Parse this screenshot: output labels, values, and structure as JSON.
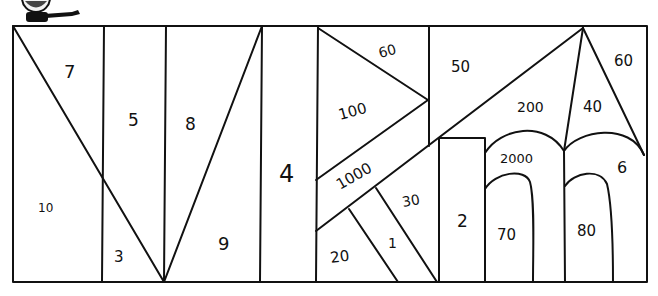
{
  "puzzle": {
    "type": "colour-by-number line drawing",
    "mascot": "cartoon-character-pointing",
    "regions": [
      {
        "id": "r7",
        "label": "7"
      },
      {
        "id": "r10",
        "label": "10"
      },
      {
        "id": "r5",
        "label": "5"
      },
      {
        "id": "r3",
        "label": "3"
      },
      {
        "id": "r8",
        "label": "8"
      },
      {
        "id": "r9",
        "label": "9"
      },
      {
        "id": "r4",
        "label": "4"
      },
      {
        "id": "r60a",
        "label": "60"
      },
      {
        "id": "r100",
        "label": "100"
      },
      {
        "id": "r1000",
        "label": "1000"
      },
      {
        "id": "r30",
        "label": "30"
      },
      {
        "id": "r1",
        "label": "1"
      },
      {
        "id": "r20",
        "label": "20"
      },
      {
        "id": "r50",
        "label": "50"
      },
      {
        "id": "r200",
        "label": "200"
      },
      {
        "id": "r2",
        "label": "2"
      },
      {
        "id": "r2000",
        "label": "2000"
      },
      {
        "id": "r70",
        "label": "70"
      },
      {
        "id": "r40",
        "label": "40"
      },
      {
        "id": "r60b",
        "label": "60"
      },
      {
        "id": "r6",
        "label": "6"
      },
      {
        "id": "r80",
        "label": "80"
      }
    ]
  },
  "colors": {
    "stroke": "#111111",
    "background": "#ffffff"
  }
}
